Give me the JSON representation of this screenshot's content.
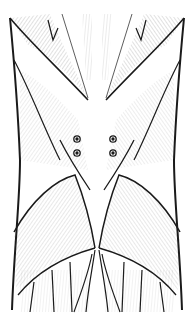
{
  "image": {
    "subject": "anatomical illustration of lower back and gluteal muscles",
    "style": "black ink hatched line drawing",
    "background": "#ffffff",
    "ink": "#1a1a1a",
    "markers": {
      "count": 4,
      "positions": [
        [
          77,
          139
        ],
        [
          77,
          153
        ],
        [
          113,
          139
        ],
        [
          113,
          153
        ]
      ]
    }
  }
}
